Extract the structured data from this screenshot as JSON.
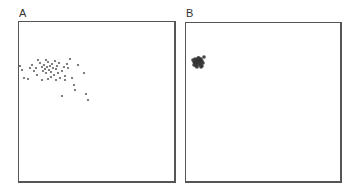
{
  "panels": [
    {
      "label": "A"
    },
    {
      "label": "B"
    }
  ],
  "chart_data": [
    {
      "type": "scatter",
      "title": "A",
      "xlabel": "",
      "ylabel": "",
      "grid": false,
      "legend": null,
      "note": "No axes or ticks shown; points given in panel pixel coordinates (origin top-left of panel, width 157, height 161)",
      "points": [
        [
          2,
          47
        ],
        [
          0,
          43
        ],
        [
          4,
          55
        ],
        [
          10,
          45
        ],
        [
          12,
          42
        ],
        [
          14,
          48
        ],
        [
          16,
          45
        ],
        [
          17,
          52
        ],
        [
          20,
          40
        ],
        [
          22,
          44
        ],
        [
          23,
          48
        ],
        [
          24,
          42
        ],
        [
          25,
          46
        ],
        [
          26,
          50
        ],
        [
          27,
          44
        ],
        [
          28,
          39
        ],
        [
          29,
          47
        ],
        [
          30,
          43
        ],
        [
          31,
          49
        ],
        [
          32,
          41
        ],
        [
          33,
          45
        ],
        [
          34,
          52
        ],
        [
          35,
          38
        ],
        [
          36,
          46
        ],
        [
          37,
          43
        ],
        [
          38,
          50
        ],
        [
          39,
          40
        ],
        [
          40,
          55
        ],
        [
          42,
          48
        ],
        [
          44,
          44
        ],
        [
          45,
          53
        ],
        [
          47,
          41
        ],
        [
          50,
          36
        ],
        [
          52,
          55
        ],
        [
          54,
          62
        ],
        [
          55,
          67
        ],
        [
          58,
          42
        ],
        [
          64,
          50
        ],
        [
          66,
          71
        ],
        [
          68,
          77
        ],
        [
          42,
          73
        ],
        [
          22,
          57
        ],
        [
          8,
          56
        ],
        [
          18,
          37
        ],
        [
          26,
          37
        ],
        [
          45,
          57
        ],
        [
          48,
          45
        ],
        [
          36,
          57
        ],
        [
          31,
          54
        ],
        [
          28,
          56
        ]
      ]
    },
    {
      "type": "scatter",
      "title": "B",
      "xlabel": "",
      "ylabel": "",
      "grid": false,
      "legend": null,
      "note": "Dense cluster near top-left; points in panel pixel coordinates (width 156, height 160)",
      "points": [
        [
          6,
          36
        ],
        [
          7,
          38
        ],
        [
          8,
          35
        ],
        [
          8,
          39
        ],
        [
          9,
          37
        ],
        [
          9,
          40
        ],
        [
          10,
          36
        ],
        [
          10,
          38
        ],
        [
          11,
          34
        ],
        [
          11,
          39
        ],
        [
          12,
          37
        ],
        [
          12,
          41
        ],
        [
          13,
          36
        ],
        [
          13,
          38
        ],
        [
          14,
          40
        ],
        [
          14,
          35
        ],
        [
          15,
          37
        ],
        [
          16,
          39
        ],
        [
          15,
          42
        ],
        [
          9,
          42
        ],
        [
          7,
          41
        ],
        [
          17,
          33
        ],
        [
          12,
          34
        ],
        [
          10,
          43
        ],
        [
          14,
          43
        ]
      ]
    }
  ]
}
